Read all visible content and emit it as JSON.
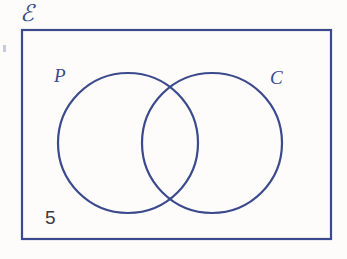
{
  "canvas": {
    "width": 347,
    "height": 259,
    "background_color": "#fdfcfb"
  },
  "colors": {
    "stroke_blue": "#3b4a8c",
    "text_dark": "#3a3a3a"
  },
  "diagram": {
    "type": "venn-two-set",
    "universal_set_label": "ℰ",
    "universal_rect": {
      "x": 21,
      "y": 29,
      "width": 311,
      "height": 211,
      "stroke_width": 2
    },
    "sets": [
      {
        "name": "set-p",
        "label": "P",
        "cx": 128,
        "cy": 143,
        "r": 70,
        "label_x": 54,
        "label_y": 66
      },
      {
        "name": "set-c",
        "label": "C",
        "cx": 212,
        "cy": 143,
        "r": 70,
        "label_x": 270,
        "label_y": 68
      }
    ],
    "region_values": [
      {
        "name": "outside-both",
        "label": "5",
        "x": 45,
        "y": 208
      }
    ]
  }
}
